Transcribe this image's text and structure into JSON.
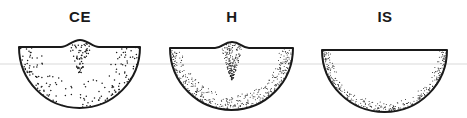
{
  "figure": {
    "background": "#ffffff",
    "ink_color": "#1a1a1a",
    "guide_line_color": "#d9d9d9",
    "guide_line_y": 64,
    "panels": [
      {
        "id": "ce",
        "label": "CE",
        "label_cx": 80,
        "top_y": 47,
        "left_x": 19,
        "right_x": 140,
        "bottom_y": 108,
        "has_bump": true,
        "bump_cx": 80,
        "bump_half_width": 19,
        "bump_height": 7,
        "stipple": "coarse",
        "central_plume": true
      },
      {
        "id": "h",
        "label": "H",
        "label_cx": 232,
        "top_y": 48,
        "left_x": 170,
        "right_x": 293,
        "bottom_y": 110,
        "has_bump": true,
        "bump_cx": 232,
        "bump_half_width": 17,
        "bump_height": 6,
        "stipple": "fine",
        "central_plume": true
      },
      {
        "id": "is",
        "label": "IS",
        "label_cx": 385,
        "top_y": 50,
        "left_x": 322,
        "right_x": 447,
        "bottom_y": 112,
        "has_bump": false,
        "stipple": "fine-rim",
        "central_plume": false
      }
    ]
  }
}
